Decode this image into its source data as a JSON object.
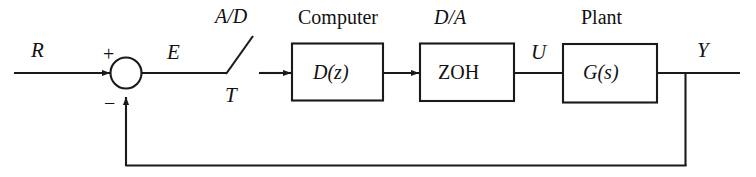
{
  "diagram": {
    "line_color": "#1a1a1a",
    "background_color": "#ffffff",
    "signals": {
      "reference": "R",
      "error": "E",
      "sample_period": "T",
      "control": "U",
      "output": "Y"
    },
    "sum_junction": {
      "plus_sign": "+",
      "minus_sign": "−"
    },
    "headers": {
      "ad_converter": "A/D",
      "computer": "Computer",
      "da_converter": "D/A",
      "plant": "Plant"
    },
    "blocks": {
      "computer": "D(z)",
      "zoh": "ZOH",
      "plant": "G(s)"
    }
  }
}
